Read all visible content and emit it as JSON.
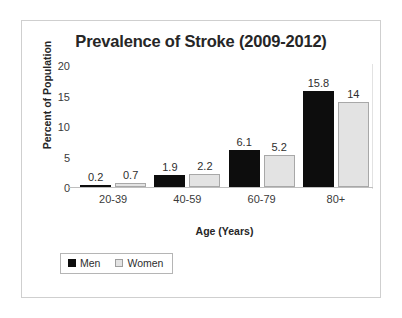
{
  "chart_data": {
    "type": "bar",
    "title": "Prevalence of Stroke (2009-2012)",
    "xlabel": "Age (Years)",
    "ylabel": "Percent of Population",
    "categories": [
      "20-39",
      "40-59",
      "60-79",
      "80+"
    ],
    "series": [
      {
        "name": "Men",
        "color": "#0d0d0d",
        "values": [
          0.2,
          1.9,
          6.1,
          15.8
        ],
        "labels": [
          "0.2",
          "1.9",
          "6.1",
          "15.8"
        ]
      },
      {
        "name": "Women",
        "color": "#e3e3e3",
        "values": [
          0.7,
          2.2,
          5.2,
          14
        ],
        "labels": [
          "0.7",
          "2.2",
          "5.2",
          "14"
        ]
      }
    ],
    "ylim": [
      0,
      20
    ],
    "yticks": [
      0,
      5,
      10,
      15,
      20
    ],
    "ytick_labels": [
      "0",
      "5",
      "10",
      "15",
      "20"
    ],
    "grid": false,
    "legend_position": "bottom-left",
    "data_labels": true
  },
  "legend": {
    "items": [
      {
        "label": "Men",
        "swatch": "men-swatch"
      },
      {
        "label": "Women",
        "swatch": "women-swatch"
      }
    ]
  }
}
